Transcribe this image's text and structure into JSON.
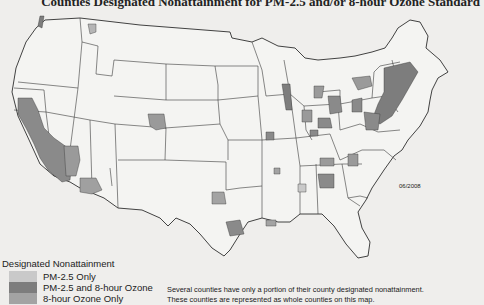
{
  "title": "Counties Designated Nonattainment for PM-2.5 and/or 8-hour Ozone Standard",
  "date_label": "06/2008",
  "legend": {
    "title": "Designated Nonattainment",
    "items": [
      {
        "label": "PM-2.5 Only",
        "color": "#c9c9c9"
      },
      {
        "label": "PM-2.5 and 8-hour Ozone",
        "color": "#7d7d7d"
      },
      {
        "label": "8-hour Ozone Only",
        "color": "#a3a3a3"
      }
    ]
  },
  "note": {
    "line1": "Several counties have only a portion of their county designated nonattainment.",
    "line2": "These counties are represented as whole counties on this map."
  },
  "colors": {
    "background": "#efeeec",
    "state_outline": "#333333",
    "land": "#f4f4f2"
  }
}
